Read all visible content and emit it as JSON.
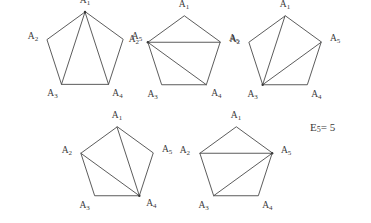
{
  "figure": {
    "background_color": "#ffffff",
    "line_color": "#4a4a4a",
    "text_color": "#3a3a3a",
    "formula": {
      "base": "E",
      "subscript": "5",
      "equals_value": "= 5",
      "full_text": "E5 = 5"
    },
    "vertex_labels": {
      "base": "A",
      "subscripts": [
        "1",
        "2",
        "3",
        "4",
        "5"
      ]
    },
    "pentagons": [
      {
        "id": "pentagon-1",
        "apex_vertex": "A1",
        "diagonals": [
          [
            "A1",
            "A3"
          ],
          [
            "A1",
            "A4"
          ]
        ],
        "diagonal_text": "A1A3, A1A4",
        "center_x": 85,
        "center_y": 52,
        "radius": 40,
        "label_offsets": {
          "A1": [
            0,
            -11
          ],
          "A2": [
            -14,
            -3
          ],
          "A3": [
            -9,
            10
          ],
          "A4": [
            9,
            10
          ],
          "A5": [
            14,
            -3
          ]
        }
      },
      {
        "id": "pentagon-2",
        "apex_vertex": "A2",
        "diagonals": [
          [
            "A2",
            "A4"
          ],
          [
            "A2",
            "A5"
          ]
        ],
        "diagonal_text": "A2A4, A2A5",
        "center_x": 184,
        "center_y": 54,
        "radius": 38,
        "label_offsets": {
          "A1": [
            0,
            -11
          ],
          "A2": [
            -14,
            -2
          ],
          "A3": [
            -9,
            10
          ],
          "A4": [
            10,
            9
          ],
          "A5": [
            14,
            -3
          ]
        }
      },
      {
        "id": "pentagon-3",
        "apex_vertex": "A3",
        "diagonals": [
          [
            "A3",
            "A1"
          ],
          [
            "A3",
            "A5"
          ]
        ],
        "diagonal_text": "A3A1, A3A5",
        "center_x": 285,
        "center_y": 54,
        "radius": 38,
        "label_offsets": {
          "A1": [
            0,
            -11
          ],
          "A2": [
            -14,
            -2
          ],
          "A3": [
            -10,
            10
          ],
          "A4": [
            9,
            10
          ],
          "A5": [
            14,
            -3
          ]
        }
      },
      {
        "id": "pentagon-4",
        "apex_vertex": "A4",
        "diagonals": [
          [
            "A4",
            "A1"
          ],
          [
            "A4",
            "A2"
          ]
        ],
        "diagonal_text": "A4A1, A4A2",
        "center_x": 117,
        "center_y": 165,
        "radius": 38,
        "label_offsets": {
          "A1": [
            0,
            -11
          ],
          "A2": [
            -14,
            -2
          ],
          "A3": [
            -10,
            10
          ],
          "A4": [
            12,
            8
          ],
          "A5": [
            14,
            -3
          ]
        }
      },
      {
        "id": "pentagon-5",
        "apex_vertex": "A5",
        "diagonals": [
          [
            "A5",
            "A2"
          ],
          [
            "A5",
            "A3"
          ]
        ],
        "diagonal_text": "A5A2, A5A3",
        "center_x": 236,
        "center_y": 165,
        "radius": 38,
        "label_offsets": {
          "A1": [
            0,
            -11
          ],
          "A2": [
            -15,
            -2
          ],
          "A3": [
            -10,
            10
          ],
          "A4": [
            9,
            10
          ],
          "A5": [
            14,
            -2
          ]
        }
      }
    ],
    "formula_position": {
      "x": 310,
      "y": 128
    }
  }
}
